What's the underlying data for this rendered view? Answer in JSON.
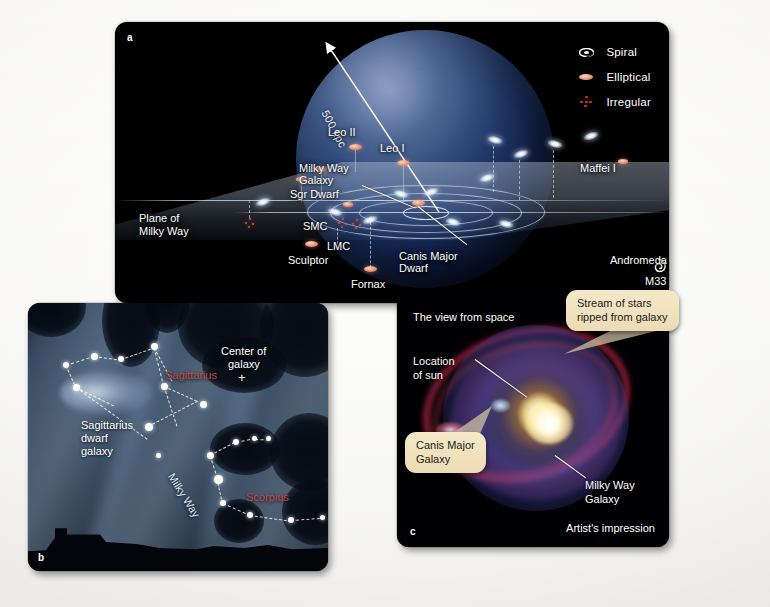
{
  "figure": {
    "background_color": "#f2f1ee",
    "panels": [
      "a",
      "b",
      "c"
    ]
  },
  "panel_a": {
    "letter": "a",
    "scale_label": "500 kpc",
    "plane_label_line1": "Plane of",
    "plane_label_line2": "Milky Way",
    "legend": {
      "items": [
        {
          "icon": "spiral-galaxy-icon",
          "label": "Spiral",
          "color": "#ffffff"
        },
        {
          "icon": "elliptical-galaxy-icon",
          "label": "Elliptical",
          "color": "#efa387"
        },
        {
          "icon": "irregular-galaxy-icon",
          "label": "Irregular",
          "color": "#d9392c"
        }
      ]
    },
    "galaxy_labels": [
      {
        "name": "Leo II"
      },
      {
        "name": "Leo I"
      },
      {
        "name": "Milky Way"
      },
      {
        "name": "Galaxy"
      },
      {
        "name": "Sgr Dwarf"
      },
      {
        "name": "SMC"
      },
      {
        "name": "LMC"
      },
      {
        "name": "Sculptor"
      },
      {
        "name": "Fornax"
      },
      {
        "name": "Canis Major"
      },
      {
        "name": "Dwarf"
      },
      {
        "name": "Maffei I"
      },
      {
        "name": "Andromeda"
      },
      {
        "name": "M33"
      }
    ]
  },
  "panel_b": {
    "letter": "b",
    "labels": {
      "center_of_galaxy_line1": "Center of",
      "center_of_galaxy_line2": "galaxy",
      "center_marker": "+",
      "sagittarius_constellation": "Sagittarius",
      "scorpius_constellation": "Scorpius",
      "dwarf_line1": "Sagittarius",
      "dwarf_line2": "dwarf",
      "dwarf_line3": "galaxy",
      "milky_way": "Milky Way"
    },
    "constellation_color": "#c0483f"
  },
  "panel_c": {
    "letter": "c",
    "view_label": "The view from space",
    "credit": "Artist's impression",
    "callouts": [
      {
        "line1": "Stream of stars",
        "line2": "ripped from galaxy"
      },
      {
        "line1": "Canis Major",
        "line2": "Galaxy"
      }
    ],
    "callout_color": "#ecdcb4",
    "labels": [
      {
        "line1": "Location",
        "line2": "of sun"
      },
      {
        "line1": "Milky Way",
        "line2": "Galaxy"
      }
    ]
  }
}
